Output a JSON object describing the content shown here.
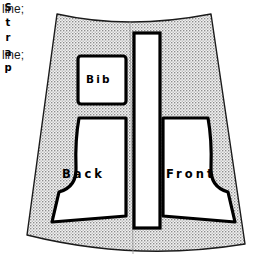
{
  "document": {
    "title": "Sewing pattern layout diagram",
    "type": "pattern-layout"
  },
  "code_text": {
    "line_1": "line;",
    "line_2": "line;"
  },
  "fabric": {
    "name": "fabric-piece",
    "fill_color": "#e9e9e9",
    "stroke_color": "#000000",
    "texture": "dotted-halftone"
  },
  "pieces": [
    {
      "id": "bib",
      "label": "Bib",
      "shape": "rounded-rectangle"
    },
    {
      "id": "strap",
      "label": "Strap",
      "letters": [
        "S",
        "t",
        "r",
        "a",
        "p"
      ],
      "shape": "tall-rectangle",
      "orientation": "vertical"
    },
    {
      "id": "back",
      "label": "Back",
      "shape": "bodice-back-with-armhole"
    },
    {
      "id": "front",
      "label": "Front",
      "shape": "bodice-front-with-armhole"
    }
  ],
  "colors": {
    "piece_fill": "#ffffff",
    "outline": "#000000",
    "text": "#000000",
    "code_text": "#1a1a1a"
  }
}
